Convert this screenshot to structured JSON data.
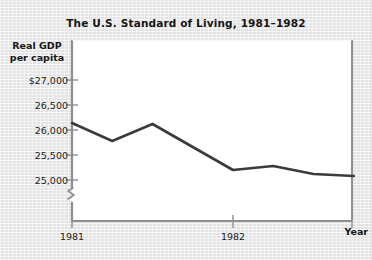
{
  "chart_data": {
    "type": "line",
    "title": "The U.S. Standard of Living, 1981–1982",
    "ylabel_line1": "Real GDP",
    "ylabel_line2": "per capita",
    "xlabel": "Year",
    "grid": false,
    "legend": null,
    "axis_break": true,
    "ylim": [
      24870,
      27080
    ],
    "yticks": [
      25000,
      25500,
      26000,
      26500,
      27000
    ],
    "ytick_labels": [
      "25,000",
      "25,500",
      "26,000",
      "26,500",
      "$27,000"
    ],
    "xticks": [
      "1981",
      "1982"
    ],
    "xtick_labels": [
      "1981",
      "1982"
    ],
    "x": [
      "1981.0",
      "1981.25",
      "1981.5",
      "1982.0",
      "1982.25",
      "1982.5",
      "1982.75"
    ],
    "values": [
      26140,
      25780,
      26120,
      25200,
      25280,
      25120,
      25080
    ],
    "line_color": "#3b3b3b",
    "line_width": 2.6,
    "plot_background": "#ffffff",
    "page_background": "#e9e9e9"
  }
}
